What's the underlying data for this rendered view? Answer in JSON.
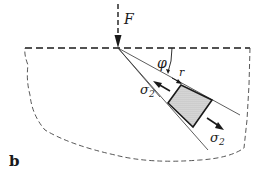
{
  "figure": {
    "panel_label": "b",
    "labels": {
      "force": "F",
      "angle": "φ",
      "radius": "r",
      "stress_upper": "σ",
      "stress_upper_sub": "2",
      "stress_lower": "σ",
      "stress_lower_sub": "2"
    },
    "colors": {
      "ink": "#1a1a1a",
      "element_fill": "#c8c8c8"
    }
  }
}
